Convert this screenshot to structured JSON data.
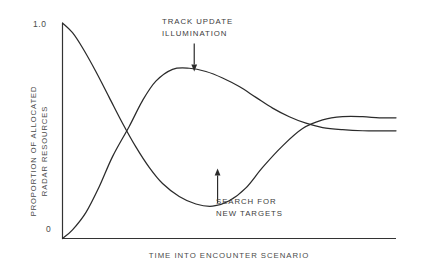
{
  "chart_data": {
    "type": "line",
    "title": "",
    "subtitle": "",
    "xlabel": "TIME INTO ENCOUNTER SCENARIO",
    "ylabel": "PROPORTION OF ALLOCATED\nRADAR RESOURCES",
    "ylabel_lines": [
      "PROPORTION OF ALLOCATED",
      "RADAR RESOURCES"
    ],
    "xlim": [
      0,
      1
    ],
    "ylim": [
      0,
      1
    ],
    "grid": false,
    "legend_position": "none",
    "y_ticks": [
      {
        "value": 1.0,
        "label": "1.0"
      },
      {
        "value": 0.0,
        "label": "0"
      }
    ],
    "x_ticks": [],
    "axis_color": "#333333",
    "line_color": "#2b2b2b",
    "background_color": "#ffffff",
    "series": [
      {
        "name": "TRACK UPDATE ILLUMINATION",
        "color": "#2b2b2b",
        "x": [
          0.0,
          0.03,
          0.07,
          0.11,
          0.15,
          0.2,
          0.24,
          0.28,
          0.33,
          0.38,
          0.43,
          0.48,
          0.53,
          0.58,
          0.63,
          0.68,
          0.73,
          0.78,
          0.84,
          0.9,
          0.95,
          1.0
        ],
        "y": [
          0.0,
          0.04,
          0.12,
          0.24,
          0.38,
          0.52,
          0.64,
          0.73,
          0.785,
          0.79,
          0.775,
          0.745,
          0.705,
          0.655,
          0.605,
          0.565,
          0.535,
          0.515,
          0.505,
          0.5,
          0.5,
          0.5
        ]
      },
      {
        "name": "SEARCH FOR NEW TARGETS",
        "color": "#2b2b2b",
        "x": [
          0.0,
          0.03,
          0.06,
          0.1,
          0.14,
          0.18,
          0.22,
          0.26,
          0.3,
          0.35,
          0.4,
          0.45,
          0.5,
          0.55,
          0.6,
          0.66,
          0.72,
          0.78,
          0.84,
          0.9,
          0.95,
          1.0
        ],
        "y": [
          1.0,
          0.955,
          0.885,
          0.775,
          0.655,
          0.535,
          0.425,
          0.33,
          0.255,
          0.195,
          0.16,
          0.15,
          0.175,
          0.235,
          0.33,
          0.43,
          0.51,
          0.55,
          0.565,
          0.565,
          0.56,
          0.56
        ]
      }
    ],
    "annotations": [
      {
        "id": "track-update",
        "text": "TRACK UPDATE\nILLUMINATION",
        "lines": [
          "TRACK UPDATE",
          "ILLUMINATION"
        ],
        "arrow": {
          "direction": "down",
          "x": 0.395,
          "y_start": 0.905,
          "y_end": 0.775
        }
      },
      {
        "id": "search-new-targets",
        "text": "SEARCH FOR\nNEW TARGETS",
        "lines": [
          "SEARCH FOR",
          "NEW TARGETS"
        ],
        "arrow": {
          "direction": "up",
          "x": 0.465,
          "y_start": 0.165,
          "y_end": 0.325
        }
      }
    ]
  }
}
